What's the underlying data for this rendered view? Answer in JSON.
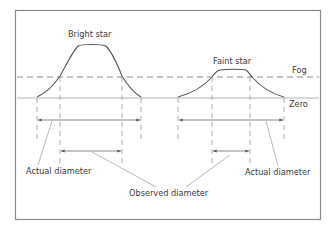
{
  "diagram": {
    "labels": {
      "bright_star": "Bright star",
      "faint_star": "Faint star",
      "fog": "Fog",
      "zero": "Zero",
      "actual_diameter_left": "Actual diameter",
      "actual_diameter_right": "Actual diameter",
      "observed_diameter": "Observed diameter"
    },
    "colors": {
      "frame": "#8a8a8a",
      "curve": "#555555",
      "zero_line": "#b5b5b5",
      "fog_line": "#8c8c8c",
      "guide": "#9a9a9a",
      "arrow": "#6a6a6a",
      "leader": "#9a9a9a"
    }
  }
}
